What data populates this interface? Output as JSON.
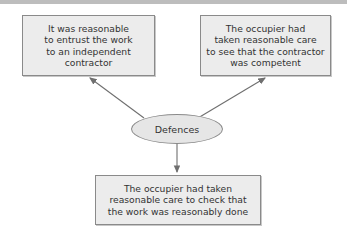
{
  "diagram": {
    "center": {
      "label": "Defences"
    },
    "nodes": [
      {
        "id": "top-left",
        "lines": [
          "It was reasonable",
          "to entrust the work",
          "to an independent",
          "contractor"
        ]
      },
      {
        "id": "top-right",
        "lines": [
          "The occupier had",
          "taken reasonable care",
          "to see that the contractor",
          "was competent"
        ]
      },
      {
        "id": "bottom",
        "lines": [
          "The occupier had taken",
          "reasonable care to check that",
          "the work was reasonably done"
        ]
      }
    ],
    "colors": {
      "box_fill": "#ececec",
      "border": "#8a8a8a",
      "arrow": "#6f6f6f",
      "text": "#333333"
    }
  }
}
